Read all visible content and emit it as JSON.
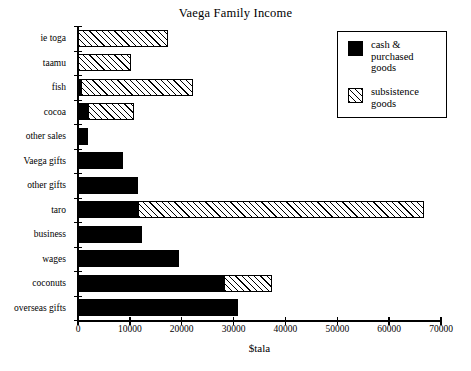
{
  "chart_data": {
    "type": "bar",
    "orientation": "horizontal",
    "stacked": true,
    "title": "Vaega Family Income",
    "xlabel": "$tala",
    "ylabel": "",
    "xlim": [
      0,
      70000
    ],
    "xticks": [
      0,
      10000,
      20000,
      30000,
      40000,
      50000,
      60000,
      70000
    ],
    "xticklabels": [
      "0",
      "10000",
      "20000",
      "30000",
      "40000",
      "50000",
      "60000",
      "70000"
    ],
    "grid": false,
    "legend_position": "upper right",
    "categories": [
      "ie toga",
      "taamu",
      "fish",
      "cocoa",
      "other sales",
      "Vaega gifts",
      "other gifts",
      "taro",
      "business",
      "wages",
      "coconuts",
      "overseas gifts"
    ],
    "series": [
      {
        "name": "cash & purchased goods",
        "color": "#000000",
        "fill": "solid",
        "values": [
          0,
          0,
          600,
          2000,
          2000,
          8700,
          11600,
          11500,
          12400,
          19500,
          28100,
          30800
        ]
      },
      {
        "name": "subsistence goods",
        "color": "#000000",
        "fill": "hatched",
        "values": [
          17300,
          10200,
          21600,
          8800,
          0,
          0,
          0,
          55300,
          0,
          0,
          9300,
          0
        ]
      }
    ],
    "totals": [
      17300,
      10200,
      22200,
      10800,
      2000,
      8700,
      11600,
      66800,
      12400,
      19500,
      37400,
      30800
    ]
  },
  "legend": {
    "entries": [
      {
        "label": "cash &\npurchased\ngoods",
        "swatch": "solid-black-swatch"
      },
      {
        "label": "subsistence\ngoods",
        "swatch": "hatched-swatch"
      }
    ]
  }
}
